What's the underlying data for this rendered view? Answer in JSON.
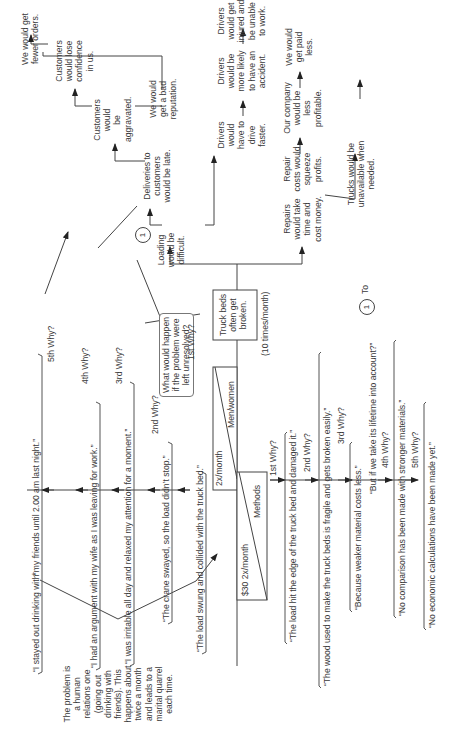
{
  "core_problem": {
    "label": "Truck beds often get broken.",
    "lines": [
      "Truck beds",
      "often get",
      "broken."
    ],
    "frequency": "(10 times/month)"
  },
  "question_bubble": {
    "lines": [
      "What would happen",
      "if the problem were",
      "left unresolved?"
    ]
  },
  "connector_label": "1",
  "consequences": {
    "loading": [
      "Loading",
      "would be",
      "difficult."
    ],
    "deliveries": [
      "Deliveries to",
      "customers",
      "would be late."
    ],
    "aggravated": [
      "Customers",
      "would",
      "be",
      "aggravated."
    ],
    "lose_confidence": [
      "Customers",
      "would lose",
      "confidence",
      "in us."
    ],
    "fewer_orders": [
      "We would get",
      "fewer orders."
    ],
    "bad_reputation": [
      "We would",
      "get a bad",
      "reputation."
    ],
    "drive_faster": [
      "Drivers",
      "would",
      "have to",
      "drive",
      "faster."
    ],
    "accident": [
      "Drivers",
      "would be",
      "more likely",
      "to have an",
      "accident."
    ],
    "injured": [
      "Drivers",
      "would get",
      "injured and",
      "be unable",
      "to work."
    ],
    "repairs": [
      "Repairs",
      "would take",
      "time and",
      "cost money."
    ],
    "repair_costs": [
      "Repair",
      "costs would",
      "squeeze",
      "profits."
    ],
    "less_profitable": [
      "Our company",
      "would be",
      "less",
      "profitable."
    ],
    "paid_less": [
      "We would",
      "get paid",
      "less."
    ],
    "unavailable": [
      "Trucks would be",
      "unavailable when",
      "needed."
    ],
    "to_label": "To"
  },
  "causes": {
    "men_women": {
      "label": "Men/women",
      "frequency": "2x/month"
    },
    "methods": {
      "label": "Methods",
      "frequency": "$30 2x/month"
    }
  },
  "human_whys": {
    "steps": [
      {
        "why": "1st Why?",
        "answer": "“The load swung and collided with the truck bed.”"
      },
      {
        "why": "2nd Why?",
        "answer": "“The crane swayed, so the load didn’t stop.”"
      },
      {
        "why": "3rd Why?",
        "answer": "“I was irritable all day and relaxed my attention for a moment.”"
      },
      {
        "why": "4th Why?",
        "answer": "“I had an argument with my wife as I was leaving for work.”"
      },
      {
        "why": "5th Why?",
        "answer": "“I stayed out drinking with my friends until 2.00 am last night.”"
      }
    ],
    "asterisk": "*",
    "note": [
      "The problem is",
      "a human",
      "relations one",
      "(going out",
      "drinking with",
      "friends). This",
      "happens about",
      "twice a month",
      "and leads to a",
      "marital quarrel",
      "each time."
    ]
  },
  "method_whys": {
    "steps": [
      {
        "why": "1st Why?",
        "answer": "“The load hit the edge of the truck bed and damaged it.”"
      },
      {
        "why": "2nd Why?",
        "answer": "“The wood used to make the truck beds is fragile and gets broken easily.”"
      },
      {
        "why": "3rd Why?",
        "answer": "“Because weaker material costs less.”"
      },
      {
        "why": "4th Why?",
        "answer": "“No comparison has been made with stronger materials.”"
      },
      {
        "why": "5th Why?",
        "answer": "“No economic calculations have been made yet.”"
      }
    ],
    "aside": "“But if we take its lifetime into account?”"
  }
}
